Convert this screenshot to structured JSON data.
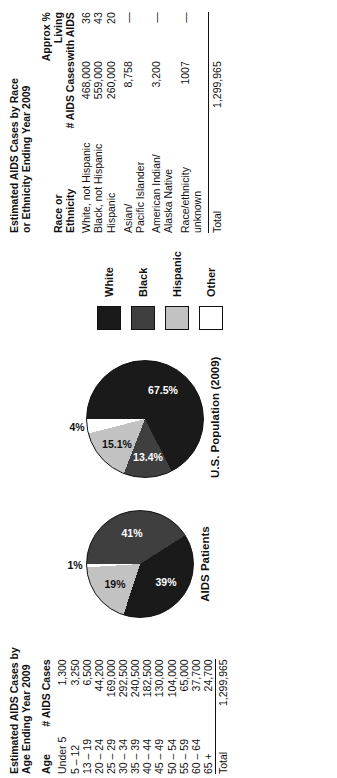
{
  "colors": {
    "white_group": "#1a1a1a",
    "black_group": "#3f3f3f",
    "hispanic_group": "#c2c2c2",
    "other_group": "#ffffff",
    "outline": "#111111",
    "page_background": "#ffffff"
  },
  "age_table": {
    "title": "Estimated AIDS Cases by\nAge Ending Year 2009",
    "columns": [
      "Age",
      "# AIDS Cases"
    ],
    "rows": [
      {
        "age": "Under 5",
        "cases": "1,300"
      },
      {
        "age": "5 – 12",
        "cases": "3,250"
      },
      {
        "age": "13 – 19",
        "cases": "6,500"
      },
      {
        "age": "20 – 24",
        "cases": "44,200"
      },
      {
        "age": "25 – 29",
        "cases": "169,000"
      },
      {
        "age": "30 – 34",
        "cases": "292,500"
      },
      {
        "age": "35 – 39",
        "cases": "240,500"
      },
      {
        "age": "40 – 44",
        "cases": "182,500"
      },
      {
        "age": "45 – 49",
        "cases": "130,000"
      },
      {
        "age": "50 – 54",
        "cases": "104,000"
      },
      {
        "age": "55 – 59",
        "cases": "65,000"
      },
      {
        "age": "60 – 64",
        "cases": "37,700"
      },
      {
        "age": "65 +",
        "cases": "24,700"
      }
    ],
    "total_label": "Total",
    "total_value": "1,299,965"
  },
  "race_table": {
    "title": "Estimated AIDS Cases by Race\nor Ethnicity Ending Year 2009",
    "columns": [
      "Race or\nEthnicity",
      "# AIDS Cases",
      "Approx %\nLiving\nwith AIDS"
    ],
    "rows": [
      {
        "group": "White, not Hispanic",
        "cases": "468,000",
        "pct_living": "36"
      },
      {
        "group": "Black, not Hispanic",
        "cases": "559,000",
        "pct_living": "43"
      },
      {
        "group": "Hispanic",
        "cases": "260,000",
        "pct_living": "20"
      },
      {
        "group": "Asian/\nPacific Islander",
        "cases": "8,758",
        "pct_living": "—"
      },
      {
        "group": "American Indian/\nAlaska Native",
        "cases": "3,200",
        "pct_living": "—"
      },
      {
        "group": "Race/ethnicity\nunknown",
        "cases": "1007",
        "pct_living": "—"
      }
    ],
    "total_label": "Total",
    "total_cases": "1,299,965",
    "total_pct": ""
  },
  "legend": {
    "items": [
      {
        "label": "White",
        "color": "#1a1a1a"
      },
      {
        "label": "Black",
        "color": "#3f3f3f"
      },
      {
        "label": "Hispanic",
        "color": "#c2c2c2"
      },
      {
        "label": "Other",
        "color": "#ffffff"
      }
    ]
  },
  "chart_data": [
    {
      "type": "pie",
      "title": "AIDS Patients",
      "categories": [
        "White",
        "Black",
        "Hispanic",
        "Other"
      ],
      "values": [
        41,
        39,
        19,
        1
      ],
      "labels": [
        "41%",
        "39%",
        "19%",
        "1%"
      ],
      "colors": [
        "#3f3f3f",
        "#1a1a1a",
        "#c2c2c2",
        "#ffffff"
      ],
      "legend_position": "right"
    },
    {
      "type": "pie",
      "title": "U.S. Population (2009)",
      "categories": [
        "White",
        "Black",
        "Hispanic",
        "Other"
      ],
      "values": [
        67.5,
        13.4,
        15.1,
        4
      ],
      "labels": [
        "67.5%",
        "13.4%",
        "15.1%",
        "4%"
      ],
      "colors": [
        "#1a1a1a",
        "#3f3f3f",
        "#c2c2c2",
        "#ffffff"
      ],
      "legend_position": "right"
    }
  ]
}
